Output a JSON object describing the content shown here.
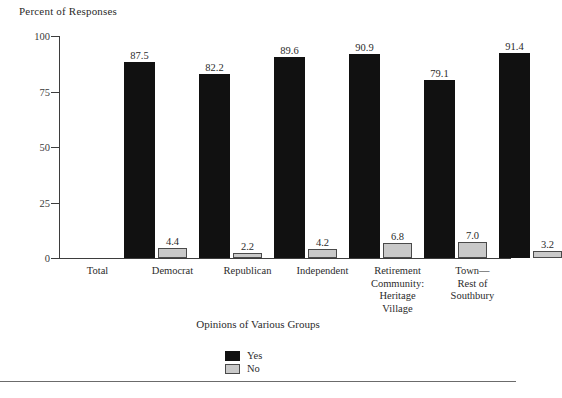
{
  "chart_data": {
    "type": "bar",
    "title": "",
    "ylabel": "Percent of Responses",
    "xlabel": "Opinions of Various Groups",
    "ylim": [
      0,
      100
    ],
    "yticks": [
      0,
      25,
      50,
      75,
      100
    ],
    "ytick_labels": [
      "0",
      "25",
      "50",
      "75",
      "100"
    ],
    "grid": false,
    "legend_position": "bottom-center",
    "categories": [
      "Total",
      "Democrat",
      "Republican",
      "Independent",
      "Retirement Community: Heritage Village",
      "Town—Rest of Southbury"
    ],
    "category_lines": [
      [
        "Total"
      ],
      [
        "Democrat"
      ],
      [
        "Republican"
      ],
      [
        "Independent"
      ],
      [
        "Retirement",
        "Community:",
        "Heritage",
        "Village"
      ],
      [
        "Town—",
        "Rest of",
        "Southbury"
      ]
    ],
    "series": [
      {
        "name": "Yes",
        "color": "#111111",
        "values": [
          87.5,
          82.2,
          89.6,
          90.9,
          79.1,
          91.4
        ],
        "labels": [
          "87.5",
          "82.2",
          "89.6",
          "90.9",
          "79.1",
          "91.4"
        ]
      },
      {
        "name": "No",
        "color": "#c9c9c9",
        "values": [
          4.4,
          2.2,
          4.2,
          6.8,
          7.0,
          3.2
        ],
        "labels": [
          "4.4",
          "2.2",
          "4.2",
          "6.8",
          "7.0",
          "3.2"
        ]
      }
    ]
  },
  "legend": {
    "items": [
      {
        "label": "Yes",
        "color": "#111111"
      },
      {
        "label": "No",
        "color": "#c9c9c9"
      }
    ]
  }
}
